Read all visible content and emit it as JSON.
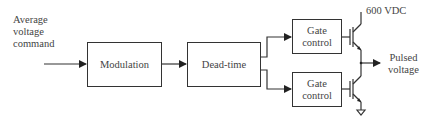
{
  "input_label": [
    "Average",
    "voltage",
    "command"
  ],
  "blocks": {
    "modulation": "Modulation",
    "dead_time": "Dead-time",
    "gate_top": [
      "Gate",
      "control"
    ],
    "gate_bottom": [
      "Gate",
      "control"
    ]
  },
  "supply_label": "600 VDC",
  "output_label": [
    "Pulsed",
    "voltage"
  ],
  "colors": {
    "line": "#333333",
    "text": "#444444",
    "background": "#ffffff"
  }
}
